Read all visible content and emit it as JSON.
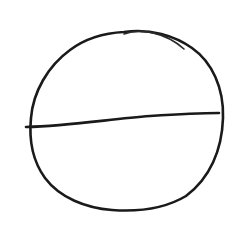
{
  "sketch": {
    "description": "Hand-drawn circle with a horizontal diameter line",
    "background_color": "#ffffff",
    "stroke_color": "#1a1a1a",
    "shapes": [
      {
        "type": "circle-outline",
        "label": "circle"
      },
      {
        "type": "line",
        "label": "diameter",
        "from": [
          26,
          127
        ],
        "to": [
          219,
          113
        ]
      }
    ]
  }
}
